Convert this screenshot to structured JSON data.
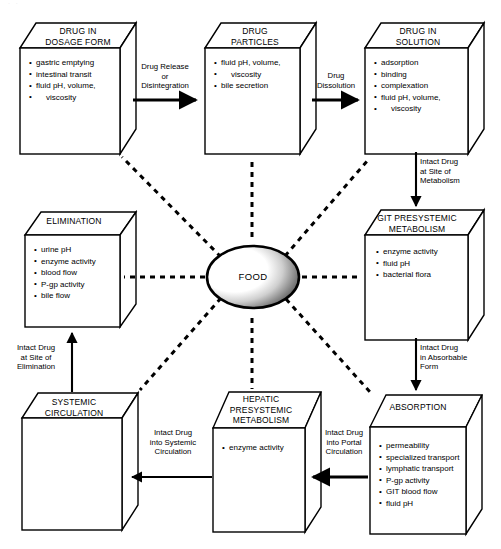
{
  "diagram": {
    "top_artifact_text": "· ·",
    "center_node": {
      "label": "FOOD",
      "shape": "ellipse",
      "fill": "gradient-white-to-dark-gray"
    },
    "colors": {
      "stroke": "#000000",
      "fill": "#ffffff",
      "background": "#ffffff",
      "oval_shade_dark": "#2b2b2b",
      "oval_shade_light": "#ffffff"
    },
    "boxes": [
      {
        "id": "drug-in-dosage-form",
        "title": "DRUG IN\nDOSAGE FORM",
        "title_lines": [
          "DRUG IN",
          "DOSAGE FORM"
        ],
        "items": [
          "gastric emptying",
          "intestinal transit",
          "fluid pH, volume,",
          "viscosity"
        ]
      },
      {
        "id": "drug-particles",
        "title": "DRUG\nPARTICLES",
        "title_lines": [
          "DRUG",
          "PARTICLES"
        ],
        "items": [
          "fluid pH, volume,",
          "viscosity",
          "bile secretion"
        ]
      },
      {
        "id": "drug-in-solution",
        "title": "DRUG IN\nSOLUTION",
        "title_lines": [
          "DRUG IN",
          "SOLUTION"
        ],
        "items": [
          "adsorption",
          "binding",
          "complexation",
          "fluid pH, volume,",
          "viscosity"
        ]
      },
      {
        "id": "elimination",
        "title": "ELIMINATION",
        "title_lines": [
          "ELIMINATION"
        ],
        "items": [
          "urine pH",
          "enzyme activity",
          "blood flow",
          "P-gp activity",
          "bile flow"
        ]
      },
      {
        "id": "git-presystemic-metabolism",
        "title": "GIT PRESYSTEMIC\nMETABOLISM",
        "title_lines": [
          "GIT PRESYSTEMIC",
          "METABOLISM"
        ],
        "items": [
          "enzyme activity",
          "fluid pH",
          "bacterial flora"
        ]
      },
      {
        "id": "systemic-circulation",
        "title": "SYSTEMIC\nCIRCULATION",
        "title_lines": [
          "SYSTEMIC",
          "CIRCULATION"
        ],
        "items": []
      },
      {
        "id": "hepatic-presystemic-metabolism",
        "title": "HEPATIC\nPRESYSTEMIC\nMETABOLISM",
        "title_lines": [
          "HEPATIC",
          "PRESYSTEMIC",
          "METABOLISM"
        ],
        "items": [
          "enzyme activity"
        ]
      },
      {
        "id": "absorption",
        "title": "ABSORPTION",
        "title_lines": [
          "ABSORPTION"
        ],
        "items": [
          "permeability",
          "specialized transport",
          "lymphatic transport",
          "P-gp activity",
          "GIT blood flow",
          "fluid pH"
        ]
      }
    ],
    "arrow_labels": [
      {
        "id": "drug-release-or-disintegration",
        "lines": [
          "Drug Release",
          "or",
          "Disintegration"
        ],
        "direction": "right"
      },
      {
        "id": "drug-dissolution",
        "lines": [
          "Drug",
          "Dissolution"
        ],
        "direction": "right"
      },
      {
        "id": "intact-drug-at-site-of-metabolism",
        "lines": [
          "Intact Drug",
          "at Site of",
          "Metabolism"
        ],
        "direction": "down"
      },
      {
        "id": "intact-drug-in-absorbable-form",
        "lines": [
          "Intact Drug",
          "in Absorbable",
          "Form"
        ],
        "direction": "down"
      },
      {
        "id": "intact-drug-into-portal-circulation",
        "lines": [
          "Intact Drug",
          "into Portal",
          "Circulation"
        ],
        "direction": "left"
      },
      {
        "id": "intact-drug-into-systemic-circulation",
        "lines": [
          "Intact Drug",
          "into Systemic",
          "Circulation"
        ],
        "direction": "left"
      },
      {
        "id": "intact-drug-at-site-of-elimination",
        "lines": [
          "Intact Drug",
          "at Site of",
          "Elimination"
        ],
        "direction": "up"
      }
    ]
  }
}
